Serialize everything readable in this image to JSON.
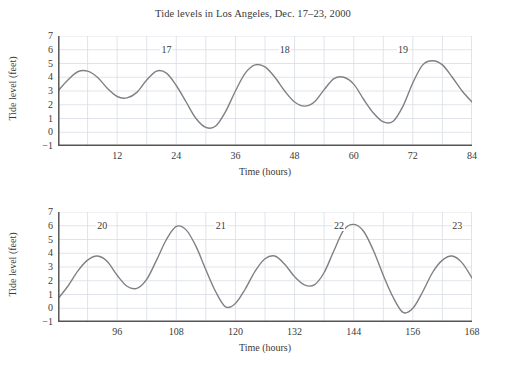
{
  "title": "Tide levels in Los Angeles, Dec. 17–23, 2000",
  "axis": {
    "xlabel": "Time (hours)",
    "ylabel": "Tide level (feet)"
  },
  "chart_data": [
    {
      "type": "line",
      "title": "Tide levels in Los Angeles, Dec. 17–23, 2000",
      "xlabel": "Time (hours)",
      "ylabel": "Tide level (feet)",
      "xlim": [
        0,
        84
      ],
      "ylim": [
        -1,
        7
      ],
      "xticks": [
        12,
        24,
        36,
        48,
        60,
        72,
        84
      ],
      "yticks": [
        -1,
        0,
        1,
        2,
        3,
        4,
        5,
        6,
        7
      ],
      "grid": true,
      "legend": "none",
      "annotations": [
        {
          "text": "17",
          "x": 22,
          "y": 6
        },
        {
          "text": "18",
          "x": 46,
          "y": 6
        },
        {
          "text": "19",
          "x": 70,
          "y": 6
        }
      ],
      "series": [
        {
          "name": "Tide level",
          "color": "#808080",
          "x": [
            0,
            2,
            4,
            6,
            8,
            10,
            12,
            14,
            16,
            18,
            20,
            22,
            24,
            26,
            28,
            30,
            32,
            34,
            36,
            38,
            40,
            42,
            44,
            46,
            48,
            50,
            52,
            54,
            56,
            58,
            60,
            62,
            64,
            66,
            68,
            70,
            72,
            74,
            76,
            78,
            80,
            82,
            84
          ],
          "values": [
            3.0,
            3.8,
            4.4,
            4.45,
            4.0,
            3.2,
            2.6,
            2.5,
            2.9,
            3.8,
            4.45,
            4.3,
            3.4,
            2.2,
            1.0,
            0.35,
            0.45,
            1.5,
            3.0,
            4.3,
            4.9,
            4.75,
            4.0,
            3.0,
            2.2,
            1.9,
            2.2,
            3.1,
            3.9,
            4.0,
            3.5,
            2.4,
            1.4,
            0.75,
            0.8,
            1.9,
            3.6,
            4.9,
            5.2,
            4.9,
            4.0,
            3.0,
            2.2
          ]
        }
      ]
    },
    {
      "type": "line",
      "xlabel": "Time (hours)",
      "ylabel": "Tide level (feet)",
      "xlim": [
        84,
        168
      ],
      "ylim": [
        -1,
        7
      ],
      "xticks": [
        96,
        108,
        120,
        132,
        144,
        156,
        168
      ],
      "yticks": [
        -1,
        0,
        1,
        2,
        3,
        4,
        5,
        6,
        7
      ],
      "grid": true,
      "legend": "none",
      "annotations": [
        {
          "text": "20",
          "x": 93,
          "y": 6
        },
        {
          "text": "21",
          "x": 117,
          "y": 6
        },
        {
          "text": "22",
          "x": 141,
          "y": 6
        },
        {
          "text": "23",
          "x": 165,
          "y": 6
        }
      ],
      "series": [
        {
          "name": "Tide level",
          "color": "#808080",
          "x": [
            84,
            86,
            88,
            90,
            92,
            94,
            96,
            98,
            100,
            102,
            104,
            106,
            108,
            110,
            112,
            114,
            116,
            118,
            120,
            122,
            124,
            126,
            128,
            130,
            132,
            134,
            136,
            138,
            140,
            142,
            144,
            146,
            148,
            150,
            152,
            154,
            156,
            158,
            160,
            162,
            164,
            166,
            168
          ],
          "values": [
            0.7,
            1.6,
            2.7,
            3.5,
            3.8,
            3.4,
            2.4,
            1.6,
            1.45,
            2.1,
            3.5,
            5.0,
            5.95,
            5.7,
            4.5,
            2.8,
            1.2,
            0.1,
            0.35,
            1.4,
            2.7,
            3.6,
            3.8,
            3.2,
            2.3,
            1.7,
            1.7,
            2.6,
            4.2,
            5.7,
            6.1,
            5.6,
            4.2,
            2.4,
            0.8,
            -0.3,
            0.0,
            1.2,
            2.6,
            3.5,
            3.8,
            3.3,
            2.2
          ]
        }
      ]
    }
  ],
  "panels": [
    {
      "id": "top",
      "xticks": [
        "12",
        "24",
        "36",
        "48",
        "60",
        "72",
        "84"
      ],
      "yticks": [
        "7",
        "6",
        "5",
        "4",
        "3",
        "2",
        "1",
        "0",
        "−1"
      ],
      "daylabels": [
        "17",
        "18",
        "19"
      ]
    },
    {
      "id": "bottom",
      "xticks": [
        "96",
        "108",
        "120",
        "132",
        "144",
        "156",
        "168"
      ],
      "yticks": [
        "7",
        "6",
        "5",
        "4",
        "3",
        "2",
        "1",
        "0",
        "−1"
      ],
      "daylabels": [
        "20",
        "21",
        "22",
        "23"
      ]
    }
  ],
  "colors": {
    "curve": "#808080",
    "grid": "#d8dde4",
    "axis": "#555555",
    "text": "#3a3a3a"
  }
}
